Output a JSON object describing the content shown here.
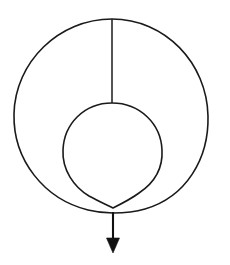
{
  "figure": {
    "background_color": "#ffffff",
    "stroke_color": "#1a1a1a",
    "arrow_color": "#111111",
    "width": 230,
    "height": 265
  },
  "geometry": {
    "outer_circle": {
      "name": "outer-circle",
      "center_x": 111,
      "center_y": 116,
      "radius": 97,
      "left_x": 14,
      "right_x": 208,
      "top_y": 19,
      "bottom_y": 213
    },
    "inner_loop": {
      "name": "inner-loop",
      "center_x": 112,
      "center_y": 153,
      "radius": 50,
      "left_x": 63,
      "right_x": 162,
      "top_y": 103,
      "bottom_y": 208
    },
    "crossing_point": {
      "name": "self-intersection",
      "x": 113,
      "y": 208
    },
    "radius_line": {
      "name": "vertical-radius-line",
      "x": 112,
      "top_y": 19,
      "bottom_y": 103
    },
    "arrow": {
      "name": "downward-arrow",
      "x": 113,
      "start_y": 212,
      "tip_y": 253,
      "head_width": 13,
      "head_length": 15
    }
  },
  "labels": {
    "figure_caption": "",
    "annotations": []
  }
}
